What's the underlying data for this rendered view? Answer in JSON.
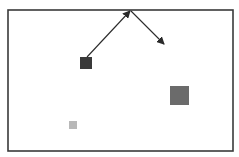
{
  "diagram": {
    "width": 239,
    "height": 157,
    "background": "#ffffff",
    "frame": {
      "x": 8,
      "y": 10,
      "width": 225,
      "height": 141,
      "stroke": "#3a3a3a",
      "stroke_width": 1.6,
      "fill": "#ffffff"
    },
    "squares": [
      {
        "id": "dark",
        "x": 80,
        "y": 57,
        "size": 12,
        "fill": "#3a3a3a"
      },
      {
        "id": "medium",
        "x": 170,
        "y": 86,
        "size": 19,
        "fill": "#6b6b6b"
      },
      {
        "id": "light",
        "x": 69,
        "y": 121,
        "size": 8,
        "fill": "#b8b8b8"
      }
    ],
    "arrows": [
      {
        "id": "arrow-up",
        "x1": 87,
        "y1": 57,
        "x2": 130,
        "y2": 11,
        "color": "#2a2a2a"
      },
      {
        "id": "arrow-down",
        "x1": 131,
        "y1": 11,
        "x2": 164,
        "y2": 44,
        "color": "#2a2a2a"
      }
    ]
  }
}
